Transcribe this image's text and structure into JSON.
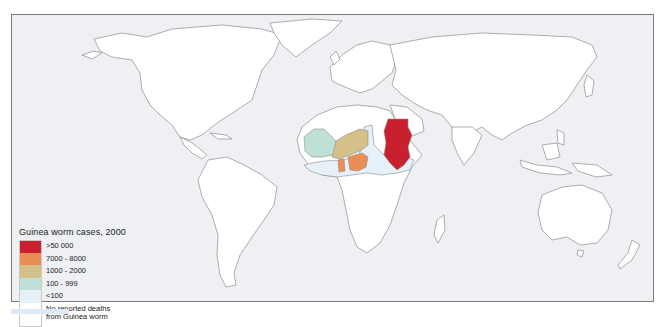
{
  "map": {
    "title": "Guinea worm cases, 2000",
    "background_color": "#eef0f3",
    "land_color": "#ffffff",
    "border_color": "#8c8c8c"
  },
  "legend": {
    "title": "Guinea worm cases, 2000",
    "items": [
      {
        "label": ">50 000",
        "color": "#c8202f"
      },
      {
        "label": "7000 - 8000",
        "color": "#ec8d55"
      },
      {
        "label": "1000 - 2000",
        "color": "#d4c088"
      },
      {
        "label": "100 - 999",
        "color": "#bfe0d6"
      },
      {
        "label": "<100",
        "color": "#e5f0f8"
      },
      {
        "label": "No reported deaths\nfrom Guinea worm",
        "line1": "No reported deaths",
        "line2": "from Guinea worm",
        "color": "#ffffff"
      }
    ]
  },
  "highlighted_regions": [
    {
      "name": "Sudan",
      "category": ">50 000",
      "color": "#c8202f"
    },
    {
      "name": "Nigeria",
      "category": "7000 - 8000",
      "color": "#ec8d55"
    },
    {
      "name": "Ghana",
      "category": "7000 - 8000",
      "color": "#ec8d55"
    },
    {
      "name": "Niger",
      "category": "1000 - 2000",
      "color": "#d4c088"
    },
    {
      "name": "Burkina Faso",
      "category": "1000 - 2000",
      "color": "#d4c088"
    },
    {
      "name": "Mali",
      "category": "100 - 999",
      "color": "#bfe0d6"
    },
    {
      "name": "Mauritania",
      "category": "100 - 999",
      "color": "#bfe0d6"
    },
    {
      "name": "Chad / Ethiopia / Uganda / Benin / Togo / Côte d'Ivoire area",
      "category": "<100",
      "color": "#e5f0f8"
    }
  ]
}
